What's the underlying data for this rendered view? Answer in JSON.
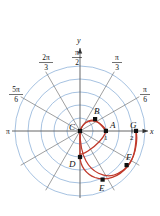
{
  "figure": {
    "type": "polar-plot",
    "title": "",
    "axes": {
      "x_label": "x",
      "y_label": "y",
      "radial_ticks": [
        {
          "value": "1",
          "r": 1
        },
        {
          "value": "2",
          "r": 2
        }
      ],
      "angle_labels": [
        {
          "text": "π/6",
          "num": "π",
          "den": "6",
          "angle_deg": 30
        },
        {
          "text": "π/3",
          "num": "π",
          "den": "3",
          "angle_deg": 60
        },
        {
          "text": "π/2",
          "num": "π",
          "den": "2",
          "angle_deg": 90
        },
        {
          "text": "2π/3",
          "num": "2π",
          "den": "3",
          "angle_deg": 120
        },
        {
          "text": "5π/6",
          "num": "5π",
          "den": "6",
          "angle_deg": 150
        },
        {
          "text": "π",
          "num": "π",
          "den": "",
          "angle_deg": 180
        }
      ]
    },
    "points": [
      {
        "label": "A",
        "angle_deg": 0,
        "r": 1.0
      },
      {
        "label": "B",
        "angle_deg": 45,
        "r": 0.78
      },
      {
        "label": "C",
        "angle_deg": 90,
        "r": 0.0
      },
      {
        "label": "D",
        "angle_deg": 270,
        "r": 0.72
      },
      {
        "label": "E",
        "angle_deg": 300,
        "r": 1.55
      },
      {
        "label": "F",
        "angle_deg": 330,
        "r": 2.05
      },
      {
        "label": "G",
        "angle_deg": 360,
        "r": 2.6
      }
    ],
    "curve": {
      "name": "spiral",
      "color": "#c0392b"
    },
    "colors": {
      "grid_circle": "#7fa8d4",
      "grid_ray": "#6b6b6b",
      "axis": "#555555",
      "curve": "#c0392b",
      "point": "#111111",
      "text": "#111111"
    }
  }
}
